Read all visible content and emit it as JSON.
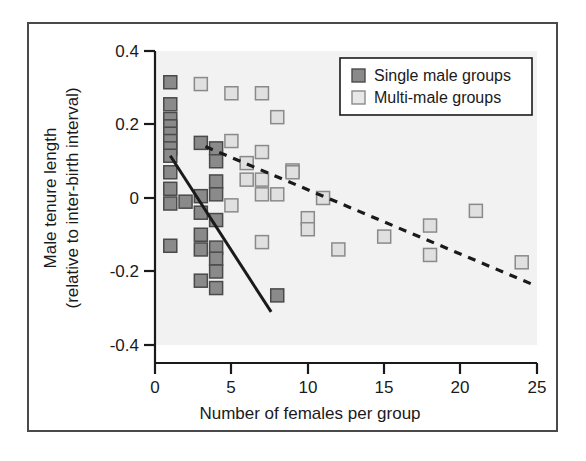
{
  "chart_data": {
    "type": "scatter",
    "title": "",
    "xlabel": "Number of females per group",
    "ylabel": "Male tenure length\n(relative to inter-birth interval)",
    "ylabel_line1": "Male tenure length",
    "ylabel_line2": "(relative to inter-birth interval)",
    "xlim": [
      0,
      25
    ],
    "ylim": [
      -0.4,
      0.4
    ],
    "xticks": [
      0,
      5,
      10,
      15,
      20,
      25
    ],
    "xtick_labels": [
      "0",
      "5",
      "10",
      "15",
      "20",
      "25"
    ],
    "yticks": [
      -0.4,
      -0.2,
      0,
      0.2,
      0.4
    ],
    "ytick_labels": [
      "-0.4",
      "-0.2",
      "0",
      "0.2",
      "0.4"
    ],
    "grid": false,
    "legend_position": "top-right",
    "plot_background": "#f2f2f2",
    "series": [
      {
        "name": "Single male groups",
        "marker": "filled-square",
        "color": "#8a8a8a",
        "edge_color": "#4a4a4a",
        "points": [
          [
            1,
            0.315
          ],
          [
            1,
            0.255
          ],
          [
            1,
            0.215
          ],
          [
            1,
            0.195
          ],
          [
            1,
            0.175
          ],
          [
            1,
            0.155
          ],
          [
            1,
            0.135
          ],
          [
            1,
            0.115
          ],
          [
            1,
            0.07
          ],
          [
            1,
            0.025
          ],
          [
            1,
            -0.015
          ],
          [
            1,
            -0.13
          ],
          [
            2,
            -0.01
          ],
          [
            3,
            0.15
          ],
          [
            3,
            0.005
          ],
          [
            3,
            -0.04
          ],
          [
            3,
            -0.1
          ],
          [
            3,
            -0.14
          ],
          [
            3,
            -0.225
          ],
          [
            4,
            0.135
          ],
          [
            4,
            0.1
          ],
          [
            4,
            0.045
          ],
          [
            4,
            0.01
          ],
          [
            4,
            -0.06
          ],
          [
            4,
            -0.135
          ],
          [
            4,
            -0.165
          ],
          [
            4,
            -0.2
          ],
          [
            4,
            -0.245
          ],
          [
            8,
            -0.265
          ]
        ]
      },
      {
        "name": "Multi-male groups",
        "marker": "open-square",
        "color": "#e0e0e0",
        "edge_color": "#8a8a8a",
        "points": [
          [
            3,
            0.31
          ],
          [
            5,
            0.285
          ],
          [
            7,
            0.285
          ],
          [
            8,
            0.22
          ],
          [
            5,
            0.155
          ],
          [
            7,
            0.125
          ],
          [
            6,
            0.095
          ],
          [
            6,
            0.05
          ],
          [
            7,
            0.05
          ],
          [
            9,
            0.075
          ],
          [
            9,
            0.07
          ],
          [
            7,
            0.01
          ],
          [
            8,
            0.01
          ],
          [
            5,
            -0.02
          ],
          [
            10,
            -0.055
          ],
          [
            10,
            -0.085
          ],
          [
            7,
            -0.12
          ],
          [
            11,
            0.0
          ],
          [
            12,
            -0.14
          ],
          [
            15,
            -0.105
          ],
          [
            18,
            -0.075
          ],
          [
            18,
            -0.155
          ],
          [
            21,
            -0.035
          ],
          [
            24,
            -0.175
          ]
        ]
      }
    ],
    "trendlines": [
      {
        "name": "single-male-trend",
        "style": "solid",
        "color": "#1a1a1a",
        "x_start": 1.0,
        "y_start": 0.115,
        "x_end": 7.6,
        "y_end": -0.31
      },
      {
        "name": "multi-male-trend",
        "style": "dashed",
        "color": "#1a1a1a",
        "x_start": 3.3,
        "y_start": 0.14,
        "x_end": 24.7,
        "y_end": -0.235
      }
    ],
    "legend": [
      {
        "label": "Single male groups",
        "marker": "filled-square"
      },
      {
        "label": "Multi-male groups",
        "marker": "open-square"
      }
    ]
  },
  "axis": {
    "x_title": "Number of females per group",
    "y_title_line1": "Male tenure length",
    "y_title_line2": "(relative to inter-birth interval)",
    "x_tick_0": "0",
    "x_tick_1": "5",
    "x_tick_2": "10",
    "x_tick_3": "15",
    "x_tick_4": "20",
    "x_tick_5": "25",
    "y_tick_0": "0.4",
    "y_tick_1": "0.2",
    "y_tick_2": "0",
    "y_tick_3": "-0.2",
    "y_tick_4": "-0.4"
  },
  "legend": {
    "item_single": "Single male groups",
    "item_multi": "Multi-male groups"
  },
  "colors": {
    "single_fill": "#8a8a8a",
    "single_edge": "#4a4a4a",
    "multi_fill": "#e8e8e8",
    "multi_edge": "#8a8a8a",
    "axis": "#1a1a1a",
    "frame": "#4a4a4a",
    "plot_bg": "#f2f2f2"
  }
}
